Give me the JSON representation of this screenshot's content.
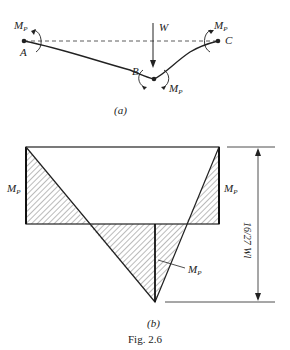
{
  "part_a": {
    "caption": "(a)",
    "labels": {
      "A": "A",
      "B": "B",
      "C": "C",
      "W": "W",
      "moment": "M",
      "moment_sub": "P"
    }
  },
  "part_b": {
    "caption": "(b)",
    "moment": "M",
    "moment_sub": "P",
    "dimension_label": "16/27 Wl"
  },
  "figure_caption": "Fig. 2.6"
}
